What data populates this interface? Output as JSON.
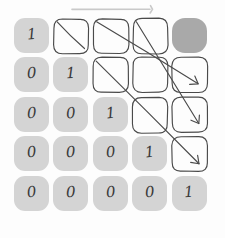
{
  "figure": {
    "rows": 5,
    "cols": 5,
    "colors": {
      "cell_fill": "#d4d4d4",
      "cell_fill_dark": "#a9a9a9",
      "cell_blank": "#fdfdfd",
      "ink": "#4a4a4a",
      "digit": "#3a3a3a",
      "background": "#fdfdfd",
      "top_arrow": "#c9c9c9"
    }
  },
  "top_arrow": {
    "name": "horizontal-sweep-arrow",
    "direction": "right",
    "x_start": 72,
    "x_end": 152,
    "y": 9
  },
  "matrix": {
    "rows": [
      {
        "index": 1,
        "cells": [
          {
            "col": 1,
            "value": "1",
            "style": "filled"
          },
          {
            "col": 2,
            "value": "",
            "style": "blank"
          },
          {
            "col": 3,
            "value": "",
            "style": "blank"
          },
          {
            "col": 4,
            "value": "",
            "style": "blank"
          },
          {
            "col": 5,
            "value": "",
            "style": "dark"
          }
        ]
      },
      {
        "index": 2,
        "cells": [
          {
            "col": 1,
            "value": "0",
            "style": "filled"
          },
          {
            "col": 2,
            "value": "1",
            "style": "filled"
          },
          {
            "col": 3,
            "value": "",
            "style": "blank"
          },
          {
            "col": 4,
            "value": "",
            "style": "blank"
          },
          {
            "col": 5,
            "value": "",
            "style": "blank"
          }
        ]
      },
      {
        "index": 3,
        "cells": [
          {
            "col": 1,
            "value": "0",
            "style": "filled"
          },
          {
            "col": 2,
            "value": "0",
            "style": "filled"
          },
          {
            "col": 3,
            "value": "1",
            "style": "filled"
          },
          {
            "col": 4,
            "value": "",
            "style": "blank"
          },
          {
            "col": 5,
            "value": "",
            "style": "blank"
          }
        ]
      },
      {
        "index": 4,
        "cells": [
          {
            "col": 1,
            "value": "0",
            "style": "filled"
          },
          {
            "col": 2,
            "value": "0",
            "style": "filled"
          },
          {
            "col": 3,
            "value": "0",
            "style": "filled"
          },
          {
            "col": 4,
            "value": "1",
            "style": "filled"
          },
          {
            "col": 5,
            "value": "",
            "style": "blank"
          }
        ]
      },
      {
        "index": 5,
        "cells": [
          {
            "col": 1,
            "value": "0",
            "style": "filled"
          },
          {
            "col": 2,
            "value": "0",
            "style": "filled"
          },
          {
            "col": 3,
            "value": "0",
            "style": "filled"
          },
          {
            "col": 4,
            "value": "0",
            "style": "filled"
          },
          {
            "col": 5,
            "value": "1",
            "style": "filled"
          }
        ]
      }
    ]
  },
  "diagonal_arrows": [
    {
      "name": "diagonal-arrow-1",
      "from_row": 1,
      "from_col": 2,
      "to_row": 1,
      "to_col": 2,
      "head": false
    },
    {
      "name": "diagonal-arrow-2",
      "from_row": 1,
      "from_col": 3,
      "to_row": 2,
      "to_col": 5,
      "head": true
    },
    {
      "name": "diagonal-arrow-3",
      "from_row": 1,
      "from_col": 4,
      "to_row": 3,
      "to_col": 5,
      "head": true
    },
    {
      "name": "diagonal-arrow-4",
      "from_row": 2,
      "from_col": 3,
      "to_row": 4,
      "to_col": 5,
      "head": true
    }
  ]
}
